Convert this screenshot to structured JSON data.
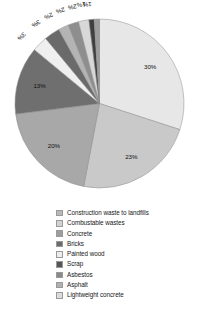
{
  "chart_data": {
    "type": "pie",
    "title": "",
    "subtitle": "",
    "xlabel": "",
    "ylabel": "",
    "grid": false,
    "legend_position": "bottom",
    "units": "percent",
    "total": 100,
    "categories": [
      "Construction waste to landfills",
      "Combustable wastes",
      "Concrete",
      "Bricks",
      "Painted wood",
      "Scrap",
      "Asbestos",
      "Asphalt",
      "Lightweight concrete"
    ],
    "values": [
      30,
      23,
      20,
      13,
      3,
      3,
      2,
      2,
      2
    ],
    "slice_labels": [
      "30%",
      "23%",
      "20%",
      "13%",
      "3%",
      "3%",
      "2%",
      "2%",
      "2%",
      "1%",
      "1%"
    ],
    "slices": [
      {
        "label": "30%",
        "value": 30,
        "color": "#e7e7e7"
      },
      {
        "label": "23%",
        "value": 23,
        "color": "#c9c9c9"
      },
      {
        "label": "20%",
        "value": 20,
        "color": "#a8a8a8"
      },
      {
        "label": "13%",
        "value": 13,
        "color": "#6f6f6f"
      },
      {
        "label": "3%",
        "value": 3,
        "color": "#efefef"
      },
      {
        "label": "3%",
        "value": 3,
        "color": "#6a6a6a"
      },
      {
        "label": "2%",
        "value": 2,
        "color": "#b4b4b4"
      },
      {
        "label": "2%",
        "value": 2,
        "color": "#8e8e8e"
      },
      {
        "label": "2%",
        "value": 2,
        "color": "#d8d8d8"
      },
      {
        "label": "1%",
        "value": 1,
        "color": "#3f3f3f"
      },
      {
        "label": "1%",
        "value": 1,
        "color": "#9c9c9c"
      }
    ],
    "legend": [
      {
        "label": "Construction waste to landfills",
        "color": "#b9b9b9"
      },
      {
        "label": "Combustable wastes",
        "color": "#d2d2d2"
      },
      {
        "label": "Concrete",
        "color": "#9d9d9d"
      },
      {
        "label": "Bricks",
        "color": "#6b6b6b"
      },
      {
        "label": "Painted wood",
        "color": "#ededed"
      },
      {
        "label": "Scrap",
        "color": "#555555"
      },
      {
        "label": "Asbestos",
        "color": "#8a8a8a"
      },
      {
        "label": "Asphalt",
        "color": "#b0b0b0"
      },
      {
        "label": "Lightweight concrete",
        "color": "#dcdcdc"
      }
    ]
  },
  "colors": {
    "background": "#ffffff",
    "text": "#161616",
    "slice_outline": "#8c8c8c"
  }
}
